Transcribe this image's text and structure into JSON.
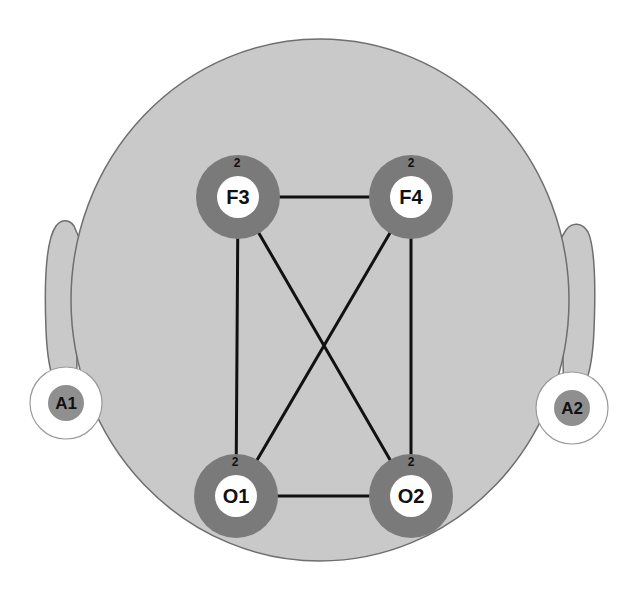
{
  "diagram": {
    "type": "eeg-electrode-montage",
    "colors": {
      "head_fill": "#c9c9c9",
      "head_stroke": "#6e6e6e",
      "electrode_ring": "#7a7a7a",
      "electrode_center": "#ffffff",
      "ear_electrode_outer": "#ffffff",
      "ear_electrode_inner": "#8f8f8f",
      "connection": "#111111"
    },
    "electrodes": [
      {
        "id": "F3",
        "label": "F3",
        "count": "2"
      },
      {
        "id": "F4",
        "label": "F4",
        "count": "2"
      },
      {
        "id": "O1",
        "label": "O1",
        "count": "2"
      },
      {
        "id": "O2",
        "label": "O2",
        "count": "2"
      }
    ],
    "reference_electrodes": [
      {
        "id": "A1",
        "label": "A1"
      },
      {
        "id": "A2",
        "label": "A2"
      }
    ],
    "connections": [
      [
        "F3",
        "F4"
      ],
      [
        "F3",
        "O1"
      ],
      [
        "F3",
        "O2"
      ],
      [
        "F4",
        "O1"
      ],
      [
        "F4",
        "O2"
      ],
      [
        "O1",
        "O2"
      ]
    ]
  }
}
